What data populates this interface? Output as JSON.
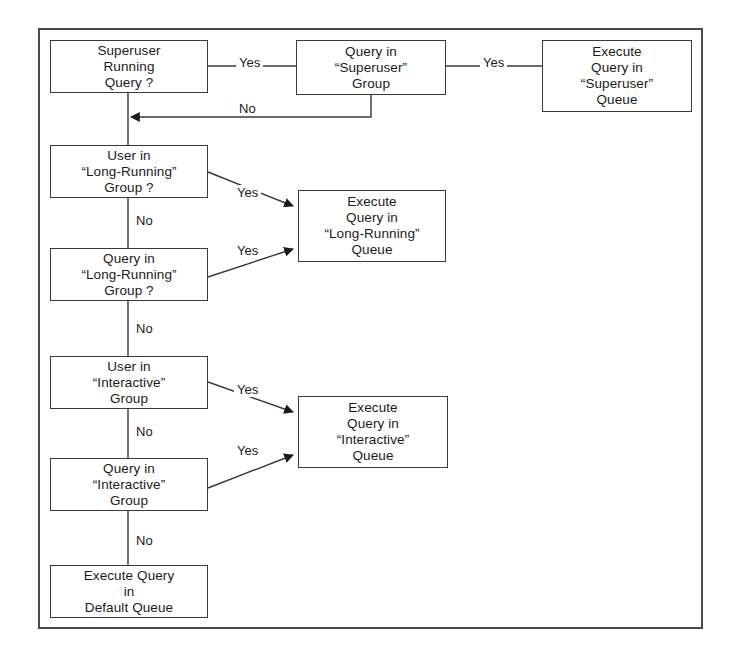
{
  "diagram": {
    "type": "flowchart",
    "frame": {
      "border_color": "#4a4a4a"
    },
    "nodes": [
      {
        "id": "superuser-running-query",
        "kind": "decision",
        "lines": [
          "Superuser",
          "Running",
          "Query ?"
        ],
        "x": 50,
        "y": 40,
        "w": 158,
        "h": 53
      },
      {
        "id": "query-in-superuser-group",
        "kind": "decision",
        "lines": [
          "Query in",
          "“Superuser”",
          "Group"
        ],
        "x": 296,
        "y": 40,
        "w": 150,
        "h": 55
      },
      {
        "id": "execute-superuser-queue",
        "kind": "terminal",
        "lines": [
          "Execute",
          "Query in",
          "“Superuser”",
          "Queue"
        ],
        "x": 542,
        "y": 40,
        "w": 150,
        "h": 72
      },
      {
        "id": "user-in-long-running-group",
        "kind": "decision",
        "lines": [
          "User in",
          "“Long-Running”",
          "Group ?"
        ],
        "x": 50,
        "y": 145,
        "w": 158,
        "h": 53
      },
      {
        "id": "execute-long-running-queue",
        "kind": "terminal",
        "lines": [
          "Execute",
          "Query in",
          "“Long-Running”",
          "Queue"
        ],
        "x": 298,
        "y": 190,
        "w": 148,
        "h": 72
      },
      {
        "id": "query-in-long-running-group",
        "kind": "decision",
        "lines": [
          "Query in",
          "“Long-Running”",
          "Group ?"
        ],
        "x": 50,
        "y": 248,
        "w": 158,
        "h": 53
      },
      {
        "id": "user-in-interactive-group",
        "kind": "decision",
        "lines": [
          "User in",
          "“Interactive”",
          "Group"
        ],
        "x": 50,
        "y": 356,
        "w": 158,
        "h": 53
      },
      {
        "id": "execute-interactive-queue",
        "kind": "terminal",
        "lines": [
          "Execute",
          "Query in",
          "“Interactive”",
          "Queue"
        ],
        "x": 298,
        "y": 396,
        "w": 150,
        "h": 72
      },
      {
        "id": "query-in-interactive-group",
        "kind": "decision",
        "lines": [
          "Query in",
          "“Interactive”",
          "Group"
        ],
        "x": 50,
        "y": 458,
        "w": 158,
        "h": 53
      },
      {
        "id": "execute-default-queue",
        "kind": "terminal",
        "lines": [
          "Execute Query",
          "in",
          "Default Queue"
        ],
        "x": 50,
        "y": 565,
        "w": 158,
        "h": 53
      }
    ],
    "edge_labels": [
      {
        "id": "yes-superuser-running",
        "text": "Yes",
        "x": 236,
        "y": 55
      },
      {
        "id": "yes-superuser-group",
        "text": "Yes",
        "x": 480,
        "y": 55
      },
      {
        "id": "no-superuser-group",
        "text": "No",
        "x": 236,
        "y": 101
      },
      {
        "id": "yes-user-long-running",
        "text": "Yes",
        "x": 234,
        "y": 185
      },
      {
        "id": "no-user-long-running",
        "text": "No",
        "x": 133,
        "y": 213
      },
      {
        "id": "yes-query-long-running",
        "text": "Yes",
        "x": 234,
        "y": 243
      },
      {
        "id": "no-query-long-running",
        "text": "No",
        "x": 133,
        "y": 321
      },
      {
        "id": "yes-user-interactive",
        "text": "Yes",
        "x": 234,
        "y": 382
      },
      {
        "id": "no-user-interactive",
        "text": "No",
        "x": 133,
        "y": 424
      },
      {
        "id": "yes-query-interactive",
        "text": "Yes",
        "x": 234,
        "y": 443
      },
      {
        "id": "no-query-interactive",
        "text": "No",
        "x": 133,
        "y": 533
      }
    ]
  }
}
